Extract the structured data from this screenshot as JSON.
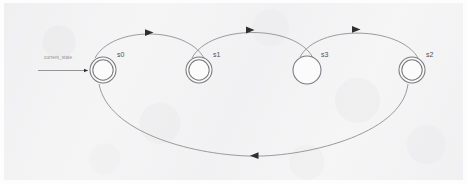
{
  "diagram": {
    "kind": "finite-state-machine",
    "title": "",
    "stroke_color": "#7a7a7e",
    "label_color": "#4f4f52",
    "background_color": "#f4f4f5",
    "initial_transition": {
      "label": "current_state",
      "target": "s0"
    },
    "states": [
      {
        "id": "s0",
        "label": "s0",
        "cx": 103,
        "cy": 70,
        "r": 13,
        "accepting": true,
        "initial": true
      },
      {
        "id": "s1",
        "label": "s1",
        "cx": 199,
        "cy": 70,
        "r": 13,
        "accepting": true,
        "initial": false
      },
      {
        "id": "s3",
        "label": "s3",
        "cx": 307,
        "cy": 70,
        "r": 14,
        "accepting": false,
        "initial": false
      },
      {
        "id": "s2",
        "label": "s2",
        "cx": 412,
        "cy": 70,
        "r": 13,
        "accepting": true,
        "initial": false
      }
    ],
    "transitions": [
      {
        "from": "s0",
        "to": "s1",
        "label": "",
        "direction": "right",
        "curve": "top"
      },
      {
        "from": "s1",
        "to": "s3",
        "label": "",
        "direction": "right",
        "curve": "top"
      },
      {
        "from": "s3",
        "to": "s2",
        "label": "",
        "direction": "right",
        "curve": "top"
      },
      {
        "from": "s2",
        "to": "s0",
        "label": "",
        "direction": "left",
        "curve": "bottom"
      }
    ]
  }
}
